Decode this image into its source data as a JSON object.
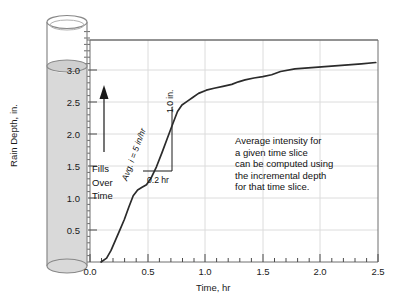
{
  "figure": {
    "background_color": "#ffffff",
    "axis_color": "#6f6f6f",
    "grid_color": "#d8d8d8",
    "curve_color": "#2b2b2b",
    "cylinder_fill_color": "#d8d8d8",
    "cylinder_line_color": "#7a7a7a"
  },
  "chart_data": {
    "type": "line",
    "title": "",
    "subtitle": "",
    "xlabel": "Time, hr",
    "ylabel": "Rain Depth, in.",
    "xlim": [
      -0.1,
      2.5
    ],
    "ylim": [
      0.0,
      3.45
    ],
    "xticks": [
      0.0,
      0.5,
      1.0,
      1.5,
      2.0,
      2.5
    ],
    "xtick_labels": [
      "0.0",
      "0.5",
      "1.0",
      "1.5",
      "2.0",
      "2.5"
    ],
    "x_minor_tick_interval": 0.1,
    "yticks": [
      0.5,
      1.0,
      1.5,
      2.0,
      2.5,
      3.0
    ],
    "ytick_labels": [
      "0.5",
      "1.0",
      "1.5",
      "2.0",
      "2.5",
      "3.0"
    ],
    "y_minor_tick_interval": 0.1,
    "grid": true,
    "grid_axes": "both",
    "legend": false,
    "series": [
      {
        "name": "Cumulative rain depth",
        "x": [
          0.0,
          0.05,
          0.09,
          0.13,
          0.17,
          0.21,
          0.25,
          0.29,
          0.33,
          0.37,
          0.41,
          0.45,
          0.5,
          0.55,
          0.6,
          0.65,
          0.69,
          0.73,
          0.78,
          0.83,
          0.88,
          0.95,
          1.02,
          1.1,
          1.18,
          1.24,
          1.3,
          1.38,
          1.46,
          1.54,
          1.62,
          1.75,
          1.9,
          2.05,
          2.2,
          2.35,
          2.48
        ],
        "y": [
          0.0,
          0.06,
          0.18,
          0.34,
          0.5,
          0.66,
          0.85,
          1.03,
          1.12,
          1.16,
          1.2,
          1.3,
          1.48,
          1.7,
          1.93,
          2.16,
          2.34,
          2.44,
          2.5,
          2.56,
          2.62,
          2.67,
          2.7,
          2.73,
          2.76,
          2.8,
          2.83,
          2.86,
          2.88,
          2.91,
          2.96,
          3.0,
          3.02,
          3.04,
          3.06,
          3.08,
          3.1
        ]
      }
    ],
    "annotations": [
      {
        "name": "slope-triangle",
        "hypotenuse_label": "Avg. i = 5 in/hr",
        "vertical_label": "1.0 in.",
        "horizontal_label": "0.2 hr",
        "x_start": 0.46,
        "x_end": 0.66,
        "y_start": 1.52,
        "y_end": 2.52
      },
      {
        "name": "explanation-note",
        "lines": [
          "Average intensity for",
          "a given time slice",
          "can be computed using",
          "the incremental depth",
          "for that time slice."
        ]
      },
      {
        "name": "fills-over-time",
        "lines": [
          "Fills",
          "Over",
          "Time"
        ],
        "arrow_direction": "up"
      }
    ]
  },
  "gauge": {
    "name": "rain-gauge-cylinder",
    "fill_level_in": 3.2,
    "fill_color": "#d8d8d8"
  },
  "annotation_note": {
    "line1": "Average intensity for",
    "line2": "a given time slice",
    "line3": "can be computed using",
    "line4": "the incremental depth",
    "line5": "for that time slice."
  },
  "fills_over_time": {
    "line1": "Fills",
    "line2": "Over",
    "line3": "Time"
  },
  "triangle_labels": {
    "hypotenuse": "Avg. i = 5 in/hr",
    "vertical": "1.0 in.",
    "horizontal": "0.2 hr"
  },
  "axis_labels": {
    "x": "Time, hr",
    "y": "Rain Depth, in."
  }
}
